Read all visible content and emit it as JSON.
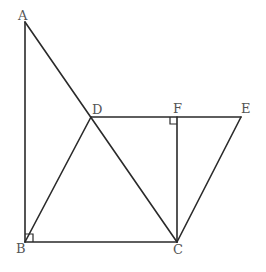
{
  "diagram": {
    "type": "geometry",
    "points": {
      "A": {
        "label": "A",
        "x": 25,
        "y": 22
      },
      "B": {
        "label": "B",
        "x": 25,
        "y": 242
      },
      "C": {
        "label": "C",
        "x": 177,
        "y": 242
      },
      "D": {
        "label": "D",
        "x": 91,
        "y": 117
      },
      "F": {
        "label": "F",
        "x": 177,
        "y": 117
      },
      "E": {
        "label": "E",
        "x": 241,
        "y": 117
      }
    },
    "segments": [
      [
        "A",
        "B"
      ],
      [
        "B",
        "C"
      ],
      [
        "A",
        "C"
      ],
      [
        "B",
        "D"
      ],
      [
        "D",
        "E"
      ],
      [
        "F",
        "C"
      ],
      [
        "E",
        "C"
      ]
    ],
    "right_angles": [
      "B",
      "F"
    ],
    "labels": {
      "A": "A",
      "B": "B",
      "C": "C",
      "D": "D",
      "E": "E",
      "F": "F"
    }
  }
}
